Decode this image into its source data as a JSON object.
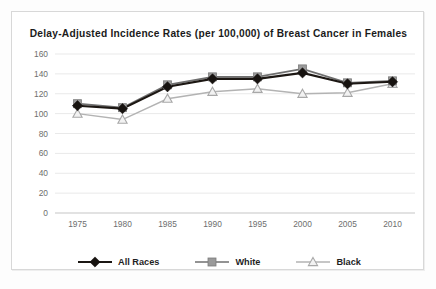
{
  "chart_data": {
    "type": "line",
    "title": "Delay-Adjusted Incidence  Rates (per 100,000) of Breast  Cancer in Females",
    "xlabel": "",
    "ylabel": "",
    "categories": [
      "1975",
      "1980",
      "1985",
      "1990",
      "1995",
      "2000",
      "2005",
      "2010"
    ],
    "x": [
      1975,
      1980,
      1985,
      1990,
      1995,
      2000,
      2005,
      2010
    ],
    "ylim": [
      0,
      160
    ],
    "yticks": [
      0,
      20,
      40,
      60,
      80,
      100,
      120,
      140,
      160
    ],
    "ytick_labels": [
      "0",
      "20",
      "40",
      "60",
      "80",
      "100",
      "120",
      "140",
      "160"
    ],
    "grid": true,
    "grid_axis": "y",
    "legend_position": "bottom",
    "series": [
      {
        "name": "All Races",
        "marker": "diamond",
        "color": "#171310",
        "values": [
          108,
          105,
          127,
          135,
          135,
          141,
          130,
          132
        ]
      },
      {
        "name": "White",
        "marker": "square",
        "color": "#9a9a9a",
        "values": [
          110,
          106,
          129,
          137,
          137,
          145,
          131,
          133
        ]
      },
      {
        "name": "Black",
        "marker": "triangle",
        "color": "#c0c0c0",
        "values": [
          100,
          94,
          115,
          122,
          125,
          120,
          121,
          130
        ]
      }
    ]
  }
}
